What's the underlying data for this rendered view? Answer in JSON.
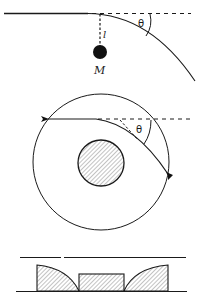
{
  "figure": {
    "panels": [
      {
        "id": "pendulum-deflection",
        "labels": {
          "length": "l",
          "mass": "M",
          "angle": "θ"
        }
      },
      {
        "id": "circular-orbit-deflection",
        "labels": {
          "angle": "θ"
        }
      },
      {
        "id": "hatched-profile",
        "labels": {}
      }
    ]
  },
  "colors": {
    "ink": "#1a1a1a",
    "background": "#ffffff",
    "hatch": "#6a6a6a"
  }
}
